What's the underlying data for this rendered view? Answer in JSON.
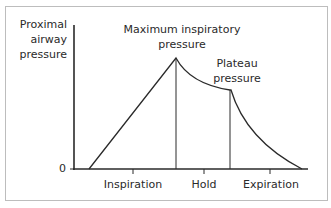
{
  "diagram": {
    "y_axis": {
      "label_lines": [
        "Proximal",
        "airway",
        "pressure"
      ],
      "zero_label": "0"
    },
    "annotations": {
      "peak_lines": [
        "Maximum inspiratory",
        "pressure"
      ],
      "plateau_lines": [
        "Plateau",
        "pressure"
      ]
    },
    "phases": [
      {
        "label": "Inspiration"
      },
      {
        "label": "Hold"
      },
      {
        "label": "Expiration"
      }
    ],
    "colors": {
      "line": "#2a2a2a",
      "frame": "#bdbdbd",
      "background": "#ffffff"
    }
  }
}
